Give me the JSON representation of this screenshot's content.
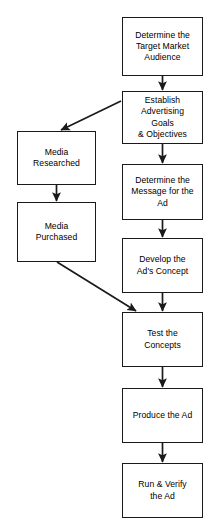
{
  "diagram": {
    "type": "flowchart",
    "background_color": "#ffffff",
    "border_color": "#1a1a1a",
    "text_color": "#000000",
    "nodes": [
      {
        "id": "determine-target-market-audience",
        "label": "Determine the\nTarget Market\nAudience",
        "column": "right",
        "x": 122,
        "y": 17,
        "w": 81,
        "h": 59
      },
      {
        "id": "establish-advertising-goals-objectives",
        "label": "Establish\nAdvertising\nGoals\n& Objectives",
        "column": "right",
        "x": 122,
        "y": 91,
        "w": 81,
        "h": 53
      },
      {
        "id": "media-researched",
        "label": "Media\nResearched",
        "column": "left",
        "x": 17,
        "y": 131,
        "w": 79,
        "h": 54
      },
      {
        "id": "determine-message-for-the-ad",
        "label": "Determine the\nMessage for the\nAd",
        "column": "right",
        "x": 122,
        "y": 164,
        "w": 81,
        "h": 56
      },
      {
        "id": "media-purchased",
        "label": "Media\nPurchased",
        "column": "left",
        "x": 17,
        "y": 202,
        "w": 79,
        "h": 60
      },
      {
        "id": "develop-ads-concept",
        "label": "Develop the\nAd's Concept",
        "column": "right",
        "x": 122,
        "y": 238,
        "w": 81,
        "h": 55
      },
      {
        "id": "test-the-concepts",
        "label": "Test the\nConcepts",
        "column": "right",
        "x": 122,
        "y": 312,
        "w": 81,
        "h": 55
      },
      {
        "id": "produce-the-ad",
        "label": "Produce the Ad",
        "column": "right",
        "x": 122,
        "y": 388,
        "w": 81,
        "h": 55
      },
      {
        "id": "run-and-verify-the-ad",
        "label": "Run & Verify\nthe Ad",
        "column": "right",
        "x": 122,
        "y": 463,
        "w": 81,
        "h": 55
      }
    ],
    "edges": [
      {
        "id": "edge-target-to-establish",
        "from": "determine-target-market-audience",
        "to": "establish-advertising-goals-objectives",
        "kind": "vertical"
      },
      {
        "id": "edge-establish-to-media-researched",
        "from": "establish-advertising-goals-objectives",
        "to": "media-researched",
        "kind": "diagonal"
      },
      {
        "id": "edge-establish-to-message",
        "from": "establish-advertising-goals-objectives",
        "to": "determine-message-for-the-ad",
        "kind": "vertical"
      },
      {
        "id": "edge-media-researched-to-media-purchased",
        "from": "media-researched",
        "to": "media-purchased",
        "kind": "vertical"
      },
      {
        "id": "edge-message-to-develop",
        "from": "determine-message-for-the-ad",
        "to": "develop-ads-concept",
        "kind": "vertical"
      },
      {
        "id": "edge-media-purchased-to-test",
        "from": "media-purchased",
        "to": "test-the-concepts",
        "kind": "diagonal"
      },
      {
        "id": "edge-develop-to-test",
        "from": "develop-ads-concept",
        "to": "test-the-concepts",
        "kind": "vertical"
      },
      {
        "id": "edge-test-to-produce",
        "from": "test-the-concepts",
        "to": "produce-the-ad",
        "kind": "vertical"
      },
      {
        "id": "edge-produce-to-run",
        "from": "produce-the-ad",
        "to": "run-and-verify-the-ad",
        "kind": "vertical"
      }
    ]
  }
}
